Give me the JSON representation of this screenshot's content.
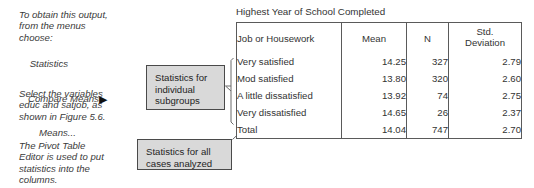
{
  "notes": {
    "obtain": "To obtain this output,\nfrom the menus\nchoose:",
    "menu_root": "Statistics",
    "menu_sub": "Compare Means",
    "menu_leaf": "Means...",
    "menu_arrow": "▶",
    "select": "Select the variables\neduc and satjob, as\nshown in Figure 5.6.",
    "pivot": "The Pivot Table\nEditor is used to put\nstatistics into the\ncolumns."
  },
  "callouts": {
    "subgroups": "Statistics for\nindividual\nsubgroups",
    "all_cases": "Statistics for all\ncases analyzed"
  },
  "table": {
    "title": "Highest Year of School Completed",
    "columns": [
      "Job or Housework",
      "Mean",
      "N",
      "Std. Deviation"
    ],
    "std_dev_line1": "Std.",
    "std_dev_line2": "Deviation",
    "rows": [
      {
        "label": "Very satisfied",
        "mean": "14.25",
        "n": "327",
        "sd": "2.79"
      },
      {
        "label": "Mod satisfied",
        "mean": "13.80",
        "n": "320",
        "sd": "2.60"
      },
      {
        "label": "A little dissatisfied",
        "mean": "13.92",
        "n": "74",
        "sd": "2.75"
      },
      {
        "label": "Very dissatisfied",
        "mean": "14.65",
        "n": "26",
        "sd": "2.37"
      },
      {
        "label": "Total",
        "mean": "14.04",
        "n": "747",
        "sd": "2.70"
      }
    ]
  },
  "colors": {
    "callout_fill": "#d9d9d9",
    "callout_border": "#4a4a4a",
    "table_border": "#5a5a5a",
    "text": "#333333",
    "background": "#ffffff"
  }
}
